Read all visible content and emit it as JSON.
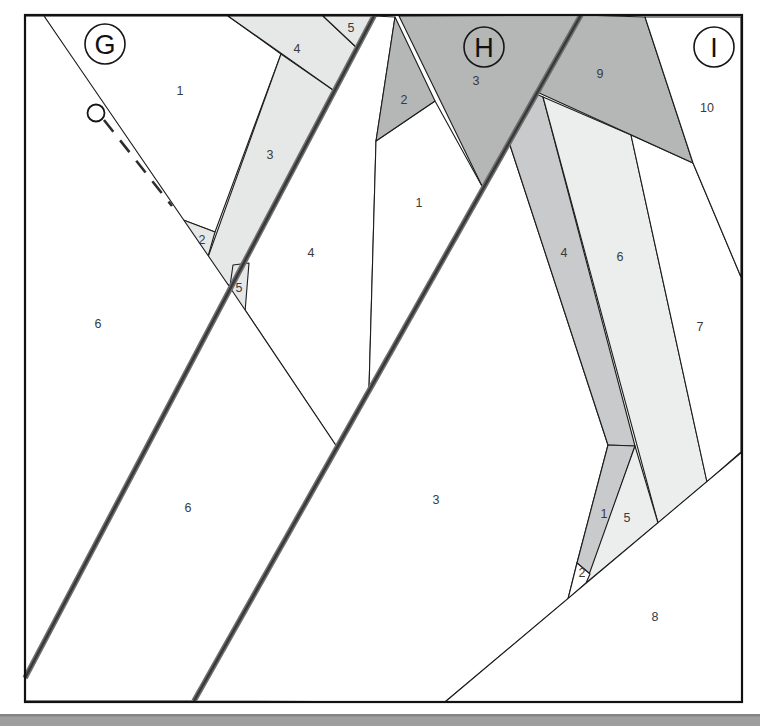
{
  "figure_type": "foundation-paper-piecing-pattern",
  "palette": {
    "white": "#ffffff",
    "light": "#e6e7e7",
    "lighter": "#eceeed",
    "mid": "#c8cacb",
    "dark": "#b5b6b6",
    "line": "#1c1c1c",
    "seam_outer": "#6e6e6e",
    "seam_core": "#383838",
    "label": "#3a3a3a",
    "border": "#111111",
    "footer_bar": "#9e9e9e",
    "footer_edge": "#858585"
  },
  "board": {
    "x": 25,
    "y": 15,
    "width": 717,
    "height": 687
  },
  "sections": [
    {
      "id": "G",
      "circle": {
        "cx": 105,
        "cy": 44,
        "r": 20
      },
      "pieces": [
        {
          "n": "1",
          "fill": "white",
          "points": "44,16 228,16 281,54 215,232 178,218",
          "label": [
            180,
            91
          ]
        },
        {
          "n": "2",
          "fill": "light",
          "points": "178,218 215,232 207,260",
          "label": [
            202,
            240
          ]
        },
        {
          "n": "3",
          "fill": "light",
          "points": "281,54 336,92 231,288 207,260",
          "label": [
            270,
            155
          ]
        },
        {
          "n": "4",
          "fill": "light",
          "points": "228,16 323,16 357,48 336,92",
          "label": [
            297,
            49
          ]
        },
        {
          "n": "5",
          "fill": "light",
          "points": "323,16 374,16 357,48",
          "label": [
            351,
            28
          ]
        },
        {
          "n": "6",
          "fill": "white",
          "points": "25,16 44,16 231,289 25,678",
          "label": [
            98,
            324
          ]
        }
      ]
    },
    {
      "id": "H",
      "circle": {
        "cx": 484,
        "cy": 47,
        "r": 20
      },
      "pieces": [
        {
          "n": "4",
          "fill": "white",
          "points": "374,16 395,17 376,141 369,389 337,447 231,289",
          "label": [
            311,
            253
          ]
        },
        {
          "n": "1",
          "fill": "white",
          "points": "376,141 435,101 483,188 369,389",
          "label": [
            419,
            203
          ]
        },
        {
          "n": "2",
          "fill": "dark",
          "points": "395,17 435,101 376,141",
          "label": [
            404,
            100
          ]
        },
        {
          "n": "3",
          "fill": "dark",
          "points": "399,16 581,15 483,188",
          "label": [
            476,
            81
          ]
        },
        {
          "n": "5",
          "fill": "light",
          "points": "233,265 249,263 245,312 229,293",
          "label": [
            239,
            288
          ]
        },
        {
          "n": "6",
          "fill": "white",
          "points": "231,289 337,447 194,701 25,701 25,678",
          "label": [
            188,
            508
          ]
        }
      ]
    },
    {
      "id": "I",
      "circle": {
        "cx": 714,
        "cy": 47,
        "r": 20
      },
      "pieces": [
        {
          "n": "3",
          "fill": "white",
          "points": "509,142 608,445 577,563 568,599 445,702 194,701",
          "label": [
            436,
            500
          ]
        },
        {
          "n": "4",
          "fill": "mid",
          "points": "509,142 536,94 543,97 635,446 608,445",
          "label": [
            564,
            253
          ]
        },
        {
          "n": "6",
          "fill": "lighter",
          "points": "543,97 631,135 707,482 658,523",
          "label": [
            620,
            257
          ]
        },
        {
          "n": "1",
          "fill": "mid",
          "points": "608,445 635,446 590,574 577,563",
          "label": [
            604,
            514
          ]
        },
        {
          "n": "5",
          "fill": "lighter",
          "points": "635,446 658,523 586,583",
          "label": [
            627,
            518
          ]
        },
        {
          "n": "2",
          "fill": "white",
          "points": "577,563 590,574 586,583 568,599",
          "label": [
            582,
            573
          ]
        },
        {
          "n": "7",
          "fill": "white",
          "points": "631,135 693,163 741,277 741,452 707,482",
          "label": [
            700,
            327
          ]
        },
        {
          "n": "8",
          "fill": "white",
          "points": "445,702 742,452 742,702",
          "label": [
            655,
            617
          ]
        },
        {
          "n": "9",
          "fill": "dark",
          "points": "581,15 645,17 693,163 537,92",
          "label": [
            600,
            74
          ]
        },
        {
          "n": "10",
          "fill": "white",
          "points": "645,17 741,17 741,277 693,163",
          "label": [
            707,
            108
          ]
        }
      ]
    }
  ],
  "seam_lines": [
    {
      "name": "seam-line-left",
      "x1": 374,
      "y1": 16,
      "x2": 25,
      "y2": 678
    },
    {
      "name": "seam-line-right",
      "x1": 581,
      "y1": 15,
      "x2": 194,
      "y2": 701
    }
  ],
  "dashed_guide": {
    "x1": 104,
    "y1": 120,
    "x2": 172,
    "y2": 206,
    "dash": "15 11"
  },
  "marker_circle": {
    "cx": 96,
    "cy": 113,
    "r": 8.5
  },
  "footer_bar": {
    "x": 0,
    "y": 714,
    "width": 760,
    "height": 12
  }
}
